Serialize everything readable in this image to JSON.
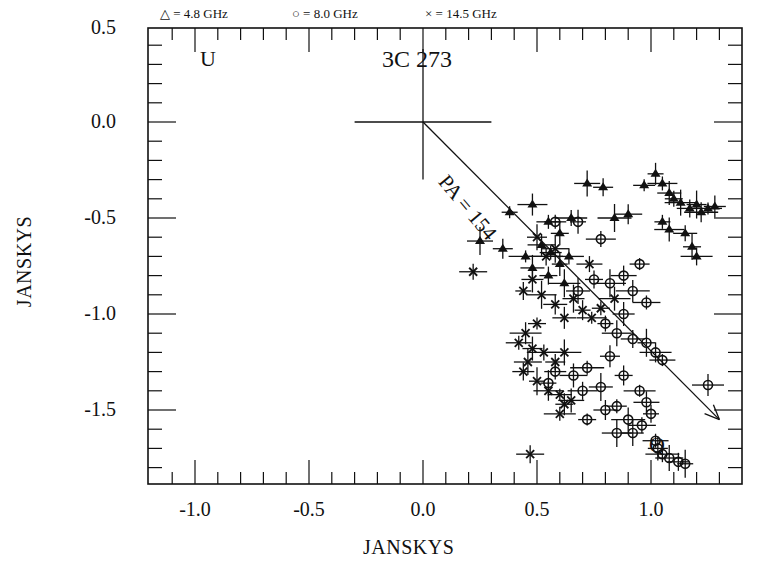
{
  "chart_data": {
    "type": "scatter",
    "title": "3C 273",
    "xlabel": "JANSKYS",
    "ylabel": "JANSKYS",
    "xlim": [
      -1.2,
      1.4
    ],
    "ylim": [
      -1.85,
      0.5
    ],
    "x_ticks": [
      "-1.0",
      "-0.5",
      "0.0",
      "0.5",
      "1.0"
    ],
    "y_ticks": [
      "0.5",
      "0.0",
      "-0.5",
      "-1.0",
      "-1.5"
    ],
    "grid": false,
    "legend_position": "top",
    "legend": [
      {
        "symbol": "triangle",
        "label": "= 4.8 GHz"
      },
      {
        "symbol": "circle",
        "label": "= 8.0 GHz"
      },
      {
        "symbol": "cross",
        "label": "= 14.5 GHz"
      }
    ],
    "annotations": {
      "corner_label": "U",
      "axis_end_label": "Q",
      "angle_label": "PA = 154",
      "origin_cross": {
        "x": 0.0,
        "y": 0.0,
        "half_length": 0.3
      },
      "arrow": {
        "from": [
          0.0,
          0.0
        ],
        "to": [
          1.3,
          -1.55
        ]
      }
    },
    "series": [
      {
        "name": "4.8 GHz",
        "marker": "triangle",
        "points": [
          [
            0.38,
            -0.47
          ],
          [
            0.48,
            -0.43
          ],
          [
            0.55,
            -0.52
          ],
          [
            0.6,
            -0.58
          ],
          [
            0.65,
            -0.5
          ],
          [
            0.72,
            -0.32
          ],
          [
            0.79,
            -0.34
          ],
          [
            0.84,
            -0.5
          ],
          [
            0.9,
            -0.48
          ],
          [
            0.97,
            -0.33
          ],
          [
            1.02,
            -0.27
          ],
          [
            1.05,
            -0.32
          ],
          [
            1.08,
            -0.37
          ],
          [
            1.1,
            -0.4
          ],
          [
            1.13,
            -0.42
          ],
          [
            1.17,
            -0.45
          ],
          [
            1.2,
            -0.43
          ],
          [
            1.22,
            -0.47
          ],
          [
            1.25,
            -0.45
          ],
          [
            1.28,
            -0.44
          ],
          [
            1.05,
            -0.52
          ],
          [
            1.08,
            -0.56
          ],
          [
            1.15,
            -0.58
          ],
          [
            1.18,
            -0.65
          ],
          [
            1.2,
            -0.7
          ],
          [
            0.25,
            -0.62
          ],
          [
            0.35,
            -0.66
          ],
          [
            0.45,
            -0.7
          ],
          [
            0.52,
            -0.64
          ],
          [
            0.56,
            -0.68
          ],
          [
            0.6,
            -0.74
          ],
          [
            0.64,
            -0.7
          ],
          [
            0.48,
            -0.76
          ],
          [
            0.55,
            -0.8
          ],
          [
            0.62,
            -0.84
          ]
        ]
      },
      {
        "name": "8.0 GHz",
        "marker": "circle",
        "points": [
          [
            0.58,
            -0.52
          ],
          [
            0.68,
            -0.52
          ],
          [
            0.78,
            -0.61
          ],
          [
            0.68,
            -0.88
          ],
          [
            0.75,
            -0.82
          ],
          [
            0.82,
            -0.84
          ],
          [
            0.88,
            -0.8
          ],
          [
            0.95,
            -0.74
          ],
          [
            0.92,
            -0.88
          ],
          [
            0.98,
            -0.94
          ],
          [
            0.88,
            -1.0
          ],
          [
            0.8,
            -1.05
          ],
          [
            0.85,
            -1.1
          ],
          [
            0.92,
            -1.13
          ],
          [
            0.98,
            -1.15
          ],
          [
            1.02,
            -1.2
          ],
          [
            1.05,
            -1.24
          ],
          [
            0.82,
            -1.22
          ],
          [
            0.72,
            -1.28
          ],
          [
            0.66,
            -1.32
          ],
          [
            0.58,
            -1.3
          ],
          [
            0.55,
            -1.36
          ],
          [
            0.7,
            -1.4
          ],
          [
            0.78,
            -1.38
          ],
          [
            0.88,
            -1.32
          ],
          [
            0.95,
            -1.4
          ],
          [
            0.98,
            -1.46
          ],
          [
            0.85,
            -1.48
          ],
          [
            0.9,
            -1.55
          ],
          [
            0.96,
            -1.58
          ],
          [
            0.92,
            -1.62
          ],
          [
            1.0,
            -1.52
          ],
          [
            0.85,
            -1.62
          ],
          [
            0.8,
            -1.5
          ],
          [
            0.72,
            -1.55
          ],
          [
            1.25,
            -1.37
          ],
          [
            1.02,
            -1.66
          ],
          [
            1.03,
            -1.7
          ],
          [
            1.05,
            -1.73
          ],
          [
            1.08,
            -1.75
          ],
          [
            1.12,
            -1.77
          ],
          [
            1.15,
            -1.78
          ]
        ]
      },
      {
        "name": "14.5 GHz",
        "marker": "cross",
        "points": [
          [
            0.22,
            -0.78
          ],
          [
            0.48,
            -0.82
          ],
          [
            0.44,
            -0.88
          ],
          [
            0.52,
            -0.9
          ],
          [
            0.58,
            -0.95
          ],
          [
            0.5,
            -1.05
          ],
          [
            0.45,
            -1.1
          ],
          [
            0.42,
            -1.15
          ],
          [
            0.48,
            -1.18
          ],
          [
            0.53,
            -1.2
          ],
          [
            0.46,
            -1.25
          ],
          [
            0.44,
            -1.3
          ],
          [
            0.5,
            -1.35
          ],
          [
            0.55,
            -1.4
          ],
          [
            0.6,
            -1.42
          ],
          [
            0.62,
            -1.47
          ],
          [
            0.6,
            -1.52
          ],
          [
            0.65,
            -1.45
          ],
          [
            0.58,
            -1.25
          ],
          [
            0.62,
            -1.2
          ],
          [
            0.47,
            -1.73
          ],
          [
            0.66,
            -0.92
          ],
          [
            0.7,
            -0.98
          ],
          [
            0.74,
            -1.02
          ],
          [
            0.62,
            -1.02
          ],
          [
            0.78,
            -0.97
          ],
          [
            0.84,
            -0.92
          ],
          [
            0.73,
            -0.74
          ],
          [
            0.5,
            -0.6
          ],
          [
            0.54,
            -0.7
          ],
          [
            0.58,
            -0.66
          ]
        ]
      }
    ]
  }
}
